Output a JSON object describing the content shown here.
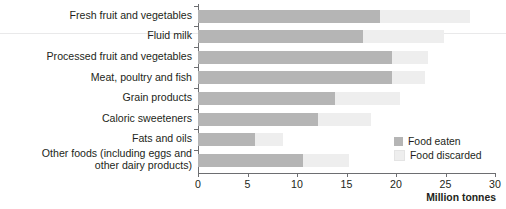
{
  "chart_data": {
    "type": "bar",
    "orientation": "horizontal",
    "stacked": true,
    "title": "",
    "xlabel": "Million tonnes",
    "ylabel": "",
    "xlim": [
      0,
      30
    ],
    "xticks": [
      0,
      5,
      10,
      15,
      20,
      25,
      30
    ],
    "grid": false,
    "legend_position": "inside-right",
    "categories": [
      "Fresh fruit and vegetables",
      "Fluid milk",
      "Processed fruit and vegetables",
      "Meat, poultry and fish",
      "Grain products",
      "Caloric sweeteners",
      "Fats and oils",
      "Other foods (including eggs and\nother dairy products)"
    ],
    "series": [
      {
        "name": "Food eaten",
        "color": "#b5b5b5",
        "values": [
          18.4,
          16.7,
          19.6,
          19.6,
          13.8,
          12.1,
          5.8,
          10.6
        ]
      },
      {
        "name": "Food discarded",
        "color": "#eeeeee",
        "values": [
          9.1,
          8.1,
          3.6,
          3.3,
          6.6,
          5.4,
          2.8,
          4.7
        ]
      }
    ],
    "totals": [
      27.5,
      24.8,
      23.2,
      22.9,
      20.4,
      17.5,
      8.6,
      15.3
    ]
  },
  "axis": {
    "x_tick_labels": [
      "0",
      "5",
      "10",
      "15",
      "20",
      "25",
      "30"
    ],
    "x_title": "Million tonnes"
  },
  "legend": {
    "items": [
      {
        "label": "Food eaten",
        "color": "#b5b5b5"
      },
      {
        "label": "Food discarded",
        "color": "#eeeeee"
      }
    ]
  },
  "colors": {
    "eaten": "#b5b5b5",
    "discarded": "#eeeeee",
    "axis": "#6d6e71",
    "text": "#231f20"
  }
}
